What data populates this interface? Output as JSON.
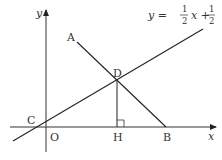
{
  "diagram": {
    "axes": {
      "x_label": "x",
      "y_label": "y",
      "origin_label": "O"
    },
    "points": {
      "A": "A",
      "B": "B",
      "C": "C",
      "D": "D",
      "H": "H"
    },
    "line_equation": {
      "prefix": "y =",
      "frac1_num": "1",
      "frac1_den": "2",
      "mid": "x +",
      "frac2_num": "1",
      "frac2_den": "2"
    },
    "colors": {
      "stroke": "#333333",
      "background": "#ffffff"
    }
  }
}
